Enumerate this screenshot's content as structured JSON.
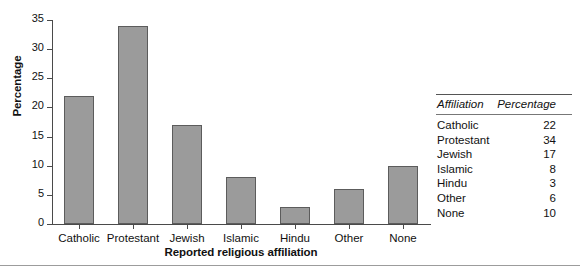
{
  "chart_data": {
    "type": "bar",
    "title": "",
    "xlabel": "Reported religious affiliation",
    "ylabel": "Percentage",
    "categories": [
      "Catholic",
      "Protestant",
      "Jewish",
      "Islamic",
      "Hindu",
      "Other",
      "None"
    ],
    "values": [
      22,
      34,
      17,
      8,
      3,
      6,
      10
    ],
    "ylim": [
      0,
      35
    ],
    "yticks": [
      0,
      5,
      10,
      15,
      20,
      25,
      30,
      35
    ],
    "ytick_labels": [
      "0",
      "5",
      "10",
      "15",
      "20",
      "25",
      "30",
      "35"
    ],
    "grid": false,
    "legend": "none",
    "bar_color": "#9b9b9b",
    "bar_edge_color": "#5c5c5c",
    "axis_color": "#4a4a4a"
  },
  "table": {
    "headers": [
      "Affiliation",
      "Percentage"
    ],
    "rows": [
      {
        "affiliation": "Catholic",
        "percentage": "22"
      },
      {
        "affiliation": "Protestant",
        "percentage": "34"
      },
      {
        "affiliation": "Jewish",
        "percentage": "17"
      },
      {
        "affiliation": "Islamic",
        "percentage": "8"
      },
      {
        "affiliation": "Hindu",
        "percentage": "3"
      },
      {
        "affiliation": "Other",
        "percentage": "6"
      },
      {
        "affiliation": "None",
        "percentage": "10"
      }
    ]
  }
}
